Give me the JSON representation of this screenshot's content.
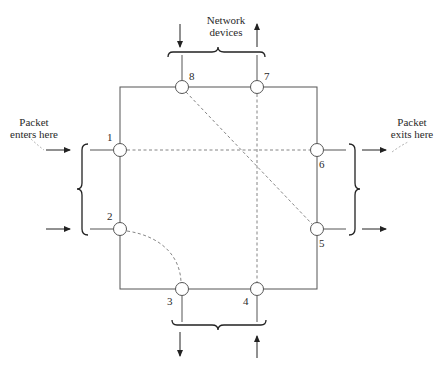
{
  "diagram": {
    "title": "Network devices",
    "labels": {
      "network_devices_line1": "Network",
      "network_devices_line2": "devices",
      "enter_line1": "Packet",
      "enter_line2": "enters here",
      "exit_line1": "Packet",
      "exit_line2": "exits here"
    },
    "nodes": [
      {
        "id": "1",
        "label": "1",
        "side": "left",
        "x": 120,
        "y": 150
      },
      {
        "id": "2",
        "label": "2",
        "side": "left",
        "x": 120,
        "y": 229
      },
      {
        "id": "3",
        "label": "3",
        "side": "bottom",
        "x": 182,
        "y": 289
      },
      {
        "id": "4",
        "label": "4",
        "side": "bottom",
        "x": 257,
        "y": 289
      },
      {
        "id": "5",
        "label": "5",
        "side": "right",
        "x": 317,
        "y": 229
      },
      {
        "id": "6",
        "label": "6",
        "side": "right",
        "x": 317,
        "y": 150
      },
      {
        "id": "7",
        "label": "7",
        "side": "top",
        "x": 257,
        "y": 87
      },
      {
        "id": "8",
        "label": "8",
        "side": "top",
        "x": 182,
        "y": 87
      }
    ],
    "internal_connections": [
      {
        "from": "1",
        "to": "6",
        "style": "dashed",
        "shape": "straight"
      },
      {
        "from": "8",
        "to": "5",
        "style": "dashed",
        "shape": "straight"
      },
      {
        "from": "7",
        "to": "4",
        "style": "dashed",
        "shape": "straight"
      },
      {
        "from": "2",
        "to": "3",
        "style": "dashed",
        "shape": "curve"
      }
    ],
    "arrows": [
      {
        "node": "1",
        "direction": "in"
      },
      {
        "node": "2",
        "direction": "in"
      },
      {
        "node": "8",
        "direction": "in"
      },
      {
        "node": "4",
        "direction": "in"
      },
      {
        "node": "6",
        "direction": "out"
      },
      {
        "node": "5",
        "direction": "out"
      },
      {
        "node": "7",
        "direction": "out"
      },
      {
        "node": "3",
        "direction": "out"
      }
    ],
    "colors": {
      "line": "#555555",
      "dashed": "#777777",
      "text": "#2a2a2a",
      "background": "#ffffff"
    }
  }
}
